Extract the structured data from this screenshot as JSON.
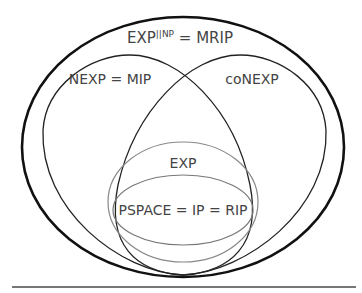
{
  "diagram": {
    "type": "venn",
    "sets": [
      {
        "id": "outer",
        "label_base": "EXP",
        "label_sup": "||NP",
        "label_rest": " = MRIP"
      },
      {
        "id": "nexp",
        "label": "NEXP = MIP"
      },
      {
        "id": "conexp",
        "label": "coNEXP"
      },
      {
        "id": "exp",
        "label": "EXP"
      },
      {
        "id": "pspace",
        "label": "PSPACE = IP = RIP"
      }
    ],
    "colors": {
      "outer": "#111111",
      "nexp": "#222222",
      "conexp": "#222222",
      "exp": "#777777",
      "pspace": "#666666",
      "text": "#444444",
      "rule": "#777777"
    }
  }
}
